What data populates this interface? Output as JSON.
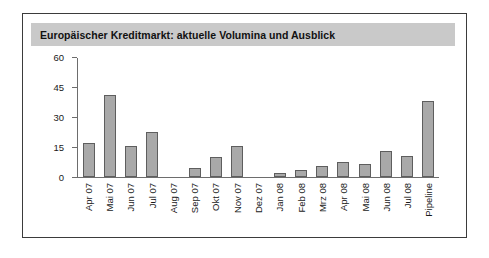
{
  "figure": {
    "title": "Europäischer Kreditmarkt: aktuelle Volumina und Ausblick",
    "frame_color": "#3b3b3b",
    "title_bar_color": "#c9c9c9",
    "background_color": "#ffffff"
  },
  "chart_data": {
    "type": "bar",
    "title": "Europäischer Kreditmarkt: aktuelle Volumina und Ausblick",
    "xlabel": "",
    "ylabel": "",
    "categories": [
      "Apr 07",
      "Mai 07",
      "Jun 07",
      "Jul 07",
      "Aug 07",
      "Sep 07",
      "Okt 07",
      "Nov 07",
      "Dez 07",
      "Jan 08",
      "Feb 08",
      "Mrz 08",
      "Apr 08",
      "Mai 08",
      "Jun 08",
      "Jul 08",
      "Pipeline"
    ],
    "values": [
      17,
      41.5,
      15.5,
      22.5,
      0,
      4.5,
      10,
      15.5,
      0,
      2,
      3.5,
      5.5,
      7.5,
      6.5,
      13,
      10.5,
      38.5
    ],
    "ylim": [
      0,
      60
    ],
    "yticks": [
      0,
      15,
      30,
      45,
      60
    ],
    "ytick_labels": [
      "0",
      "15",
      "30",
      "45",
      "60"
    ],
    "grid": false,
    "legend": false,
    "bar_color": "#a9a9a9",
    "bar_edge_color": "#5e5e5e",
    "axis_color": "#6d6d6d"
  }
}
